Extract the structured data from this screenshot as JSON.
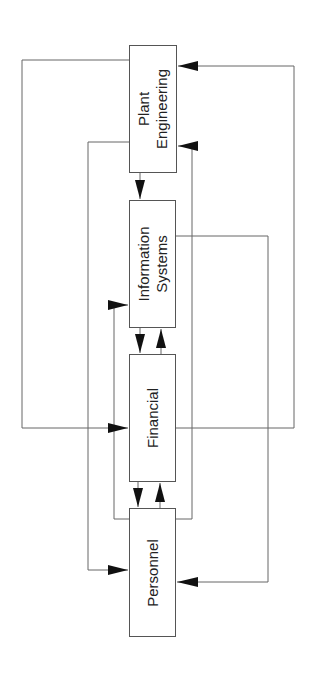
{
  "diagram": {
    "orientation": "rotated -90deg (text reads bottom-to-top)",
    "nodes": [
      {
        "id": "plant_engineering",
        "lines": [
          "Plant",
          "Engineering"
        ]
      },
      {
        "id": "information_systems",
        "lines": [
          "Information",
          "Systems"
        ]
      },
      {
        "id": "financial",
        "lines": [
          "Financial"
        ]
      },
      {
        "id": "personnel",
        "lines": [
          "Personnel"
        ]
      }
    ],
    "edges": [
      {
        "from": "Plant Engineering",
        "to": "Information Systems"
      },
      {
        "from": "Plant Engineering",
        "to": "Financial"
      },
      {
        "from": "Plant Engineering",
        "to": "Personnel"
      },
      {
        "from": "Information Systems",
        "to": "Financial"
      },
      {
        "from": "Information Systems",
        "to": "Personnel"
      },
      {
        "from": "Financial",
        "to": "Information Systems"
      },
      {
        "from": "Financial",
        "to": "Personnel"
      },
      {
        "from": "Financial",
        "to": "Plant Engineering"
      },
      {
        "from": "Personnel",
        "to": "Financial"
      },
      {
        "from": "Personnel",
        "to": "Information Systems"
      },
      {
        "from": "Personnel",
        "to": "Plant Engineering"
      }
    ],
    "colors": {
      "line": "#555555",
      "arrow": "#111111",
      "box_border": "#555555",
      "text": "#222222"
    }
  }
}
